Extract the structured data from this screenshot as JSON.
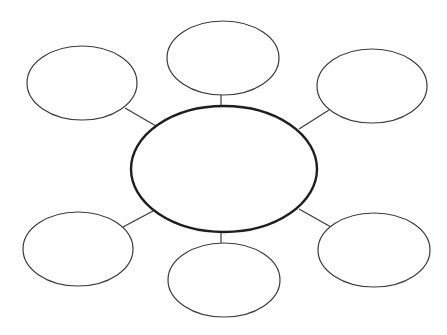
{
  "diagram": {
    "type": "bubble-map",
    "background": "#ffffff",
    "stroke_color": "#3a3a3a",
    "center": {
      "label": "",
      "cx": 224,
      "cy": 169,
      "rx": 93,
      "ry": 63
    },
    "nodes": [
      {
        "id": "top-left",
        "label": "",
        "cx": 82,
        "cy": 83,
        "rx": 55,
        "ry": 37
      },
      {
        "id": "top-center",
        "label": "",
        "cx": 223,
        "cy": 58,
        "rx": 56,
        "ry": 37
      },
      {
        "id": "top-right",
        "label": "",
        "cx": 372,
        "cy": 86,
        "rx": 55,
        "ry": 37
      },
      {
        "id": "bottom-left",
        "label": "",
        "cx": 78,
        "cy": 249,
        "rx": 55,
        "ry": 37
      },
      {
        "id": "bottom-center",
        "label": "",
        "cx": 224,
        "cy": 280,
        "rx": 56,
        "ry": 37
      },
      {
        "id": "bottom-right",
        "label": "",
        "cx": 374,
        "cy": 250,
        "rx": 56,
        "ry": 37
      }
    ],
    "connectors": [
      {
        "from": "center",
        "to": "top-left",
        "x1": 156,
        "y1": 126,
        "x2": 125,
        "y2": 108
      },
      {
        "from": "center",
        "to": "top-center",
        "x1": 221,
        "y1": 106,
        "x2": 221,
        "y2": 95
      },
      {
        "from": "center",
        "to": "top-right",
        "x1": 299,
        "y1": 129,
        "x2": 329,
        "y2": 110
      },
      {
        "from": "center",
        "to": "bottom-left",
        "x1": 153,
        "y1": 211,
        "x2": 123,
        "y2": 227
      },
      {
        "from": "center",
        "to": "bottom-center",
        "x1": 221,
        "y1": 232,
        "x2": 221,
        "y2": 243
      },
      {
        "from": "center",
        "to": "bottom-right",
        "x1": 299,
        "y1": 209,
        "x2": 331,
        "y2": 227
      }
    ]
  }
}
